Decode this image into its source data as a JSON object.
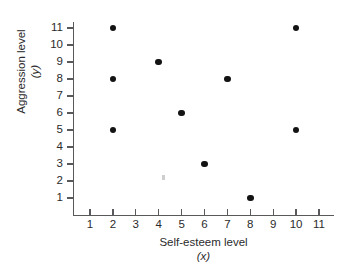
{
  "chart_data": {
    "type": "scatter",
    "title": "",
    "xlabel": "Self-esteem level",
    "xlabel_variable": "(x)",
    "ylabel": "Aggression level",
    "ylabel_variable": "(y)",
    "xlim": [
      0,
      11.9
    ],
    "ylim": [
      0,
      11.6
    ],
    "grid": false,
    "legend": "none",
    "x_ticks": [
      1,
      2,
      3,
      4,
      5,
      6,
      7,
      8,
      9,
      10,
      11
    ],
    "y_ticks": [
      1,
      2,
      3,
      4,
      5,
      6,
      7,
      8,
      9,
      10,
      11
    ],
    "x_tick_labels": [
      "1",
      "2",
      "3",
      "4",
      "5",
      "6",
      "7",
      "8",
      "9",
      "10",
      "11"
    ],
    "y_tick_labels": [
      "1",
      "2",
      "3",
      "4",
      "5",
      "6",
      "7",
      "8",
      "9",
      "10",
      "11"
    ],
    "marker": "filled-circle",
    "marker_color": "#131313",
    "axis_color": "#59595b",
    "background_color": "#ffffff",
    "n_points": 10,
    "x": [
      2,
      10,
      4,
      2,
      7,
      5,
      2,
      10,
      6,
      8
    ],
    "y": [
      11,
      11,
      9,
      8,
      8,
      6,
      5,
      5,
      3,
      1
    ],
    "points": [
      {
        "x": 2,
        "y": 11
      },
      {
        "x": 10,
        "y": 11
      },
      {
        "x": 4,
        "y": 9
      },
      {
        "x": 2,
        "y": 8
      },
      {
        "x": 7,
        "y": 8
      },
      {
        "x": 5,
        "y": 6
      },
      {
        "x": 2,
        "y": 5
      },
      {
        "x": 10,
        "y": 5
      },
      {
        "x": 6,
        "y": 3
      },
      {
        "x": 8,
        "y": 1
      }
    ],
    "artifacts": [
      {
        "name": "faint-gray-speck",
        "x": 4.2,
        "y": 2.2,
        "color": "#c9c9cb"
      }
    ]
  }
}
